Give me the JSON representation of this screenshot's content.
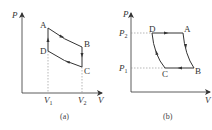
{
  "diagram_a": {
    "caption": "(a)",
    "axis_y_label": "P",
    "axis_x_label": "V",
    "points": {
      "A": "A",
      "B": "B",
      "C": "C",
      "D": "D"
    },
    "v1_label": "V",
    "v1_sub": "1",
    "v2_label": "V",
    "v2_sub": "2",
    "cycle": [
      "D->A (isochoric, up)",
      "A->B (curve, right)",
      "B->C (isochoric, down)",
      "C->D (curve, left)"
    ]
  },
  "diagram_b": {
    "caption": "(b)",
    "axis_y_label": "P",
    "axis_x_label": "V",
    "points": {
      "A": "A",
      "B": "B",
      "C": "C",
      "D": "D"
    },
    "p2_label": "P",
    "p2_sub": "2",
    "p1_label": "P",
    "p1_sub": "1",
    "cycle": [
      "D->A (isobaric, right)",
      "A->B (curve, down)",
      "B->C (isobaric, left)",
      "C->D (curve, up)"
    ]
  },
  "colors": {
    "line": "#333333",
    "dashed": "#888888",
    "text": "#333333"
  }
}
